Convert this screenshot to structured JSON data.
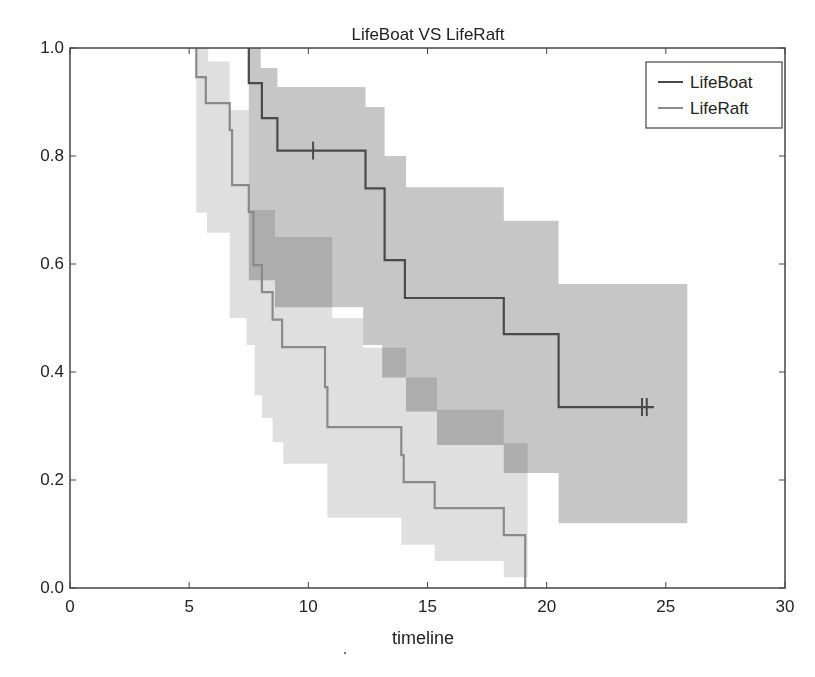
{
  "chart_data": {
    "type": "line",
    "subtype": "kaplan-meier-step-with-confidence-bands",
    "title": "LifeBoat VS LifeRaft",
    "xlabel": "timeline",
    "ylabel": "",
    "xlim": [
      0,
      30
    ],
    "ylim": [
      0.0,
      1.0
    ],
    "xticks": [
      0,
      5,
      10,
      15,
      20,
      25,
      30
    ],
    "xtick_labels": [
      "0",
      "5",
      "10",
      "15",
      "20",
      "25",
      "30"
    ],
    "yticks": [
      0.0,
      0.2,
      0.4,
      0.6,
      0.8,
      1.0
    ],
    "ytick_labels": [
      "0.0",
      "0.2",
      "0.4",
      "0.6",
      "0.8",
      "1.0"
    ],
    "grid": false,
    "legend_position": "upper right",
    "series": [
      {
        "name": "LifeBoat",
        "color": "#4a4a4a",
        "band_color": "#b3b3b3",
        "steps": [
          [
            7.5,
            1.0
          ],
          [
            7.5,
            0.935
          ],
          [
            8.05,
            0.87
          ],
          [
            8.7,
            0.81
          ],
          [
            12.4,
            0.74
          ],
          [
            13.2,
            0.607
          ],
          [
            14.05,
            0.537
          ],
          [
            18.2,
            0.47
          ],
          [
            20.5,
            0.335
          ],
          [
            24.5,
            0.335
          ]
        ],
        "censored": [
          [
            10.2,
            0.81
          ],
          [
            24.0,
            0.335
          ],
          [
            24.2,
            0.335
          ]
        ],
        "ci_upper": [
          [
            7.5,
            1.0
          ],
          [
            8.0,
            1.0
          ],
          [
            8.0,
            0.963
          ],
          [
            8.7,
            0.963
          ],
          [
            8.7,
            0.928
          ],
          [
            12.4,
            0.928
          ],
          [
            12.4,
            0.891
          ],
          [
            13.2,
            0.891
          ],
          [
            13.2,
            0.8
          ],
          [
            14.1,
            0.8
          ],
          [
            14.1,
            0.742
          ],
          [
            18.2,
            0.742
          ],
          [
            18.2,
            0.68
          ],
          [
            20.5,
            0.68
          ],
          [
            20.5,
            0.563
          ],
          [
            25.9,
            0.563
          ]
        ],
        "ci_lower": [
          [
            7.5,
            1.0
          ],
          [
            7.5,
            0.57
          ],
          [
            8.6,
            0.57
          ],
          [
            8.6,
            0.52
          ],
          [
            11.0,
            0.52
          ],
          [
            11.0,
            0.52
          ],
          [
            12.3,
            0.52
          ],
          [
            12.3,
            0.45
          ],
          [
            13.1,
            0.45
          ],
          [
            13.1,
            0.39
          ],
          [
            14.1,
            0.39
          ],
          [
            14.1,
            0.327
          ],
          [
            15.4,
            0.327
          ],
          [
            15.4,
            0.265
          ],
          [
            18.2,
            0.265
          ],
          [
            18.2,
            0.213
          ],
          [
            20.5,
            0.213
          ],
          [
            20.5,
            0.12
          ],
          [
            25.9,
            0.12
          ]
        ]
      },
      {
        "name": "LifeRaft",
        "color": "#8a8a8a",
        "band_color": "#dcdcdc",
        "steps": [
          [
            5.3,
            1.0
          ],
          [
            5.3,
            0.946
          ],
          [
            5.7,
            0.898
          ],
          [
            6.7,
            0.848
          ],
          [
            6.8,
            0.746
          ],
          [
            7.5,
            0.696
          ],
          [
            7.7,
            0.598
          ],
          [
            8.05,
            0.548
          ],
          [
            8.5,
            0.497
          ],
          [
            8.9,
            0.446
          ],
          [
            10.7,
            0.372
          ],
          [
            10.8,
            0.298
          ],
          [
            13.9,
            0.246
          ],
          [
            14.0,
            0.196
          ],
          [
            15.3,
            0.148
          ],
          [
            18.2,
            0.098
          ],
          [
            19.1,
            0.0
          ]
        ],
        "censored": [],
        "ci_upper": [
          [
            5.3,
            1.0
          ],
          [
            5.8,
            1.0
          ],
          [
            5.8,
            0.975
          ],
          [
            6.7,
            0.975
          ],
          [
            6.7,
            0.885
          ],
          [
            7.5,
            0.885
          ],
          [
            7.5,
            0.7
          ],
          [
            8.6,
            0.7
          ],
          [
            8.6,
            0.65
          ],
          [
            11.0,
            0.65
          ],
          [
            11.0,
            0.5
          ],
          [
            12.3,
            0.5
          ],
          [
            12.3,
            0.445
          ],
          [
            14.1,
            0.445
          ],
          [
            14.1,
            0.39
          ],
          [
            15.4,
            0.39
          ],
          [
            15.4,
            0.33
          ],
          [
            18.2,
            0.33
          ],
          [
            18.2,
            0.268
          ],
          [
            19.2,
            0.268
          ],
          [
            19.2,
            0.0
          ]
        ],
        "ci_lower": [
          [
            5.3,
            1.0
          ],
          [
            5.3,
            0.695
          ],
          [
            5.75,
            0.695
          ],
          [
            5.75,
            0.658
          ],
          [
            6.7,
            0.658
          ],
          [
            6.7,
            0.5
          ],
          [
            7.4,
            0.5
          ],
          [
            7.4,
            0.45
          ],
          [
            7.75,
            0.45
          ],
          [
            7.75,
            0.357
          ],
          [
            8.05,
            0.357
          ],
          [
            8.05,
            0.315
          ],
          [
            8.5,
            0.315
          ],
          [
            8.5,
            0.27
          ],
          [
            8.95,
            0.27
          ],
          [
            8.95,
            0.23
          ],
          [
            10.8,
            0.23
          ],
          [
            10.8,
            0.13
          ],
          [
            13.9,
            0.13
          ],
          [
            13.9,
            0.08
          ],
          [
            15.3,
            0.08
          ],
          [
            15.3,
            0.05
          ],
          [
            18.2,
            0.05
          ],
          [
            18.2,
            0.02
          ],
          [
            19.2,
            0.02
          ],
          [
            19.2,
            0.0
          ]
        ]
      }
    ]
  },
  "legend": {
    "items": [
      {
        "label": "LifeBoat",
        "color": "#4a4a4a"
      },
      {
        "label": "LifeRaft",
        "color": "#8a8a8a"
      }
    ]
  }
}
